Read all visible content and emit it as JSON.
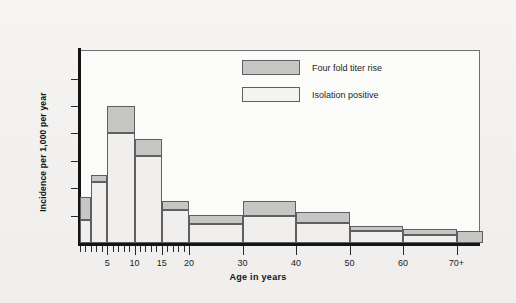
{
  "chart_data": {
    "type": "bar",
    "title": "",
    "subtitle": "",
    "xlabel": "Age in years",
    "ylabel": "Incidence per 1,000 per year",
    "stacked": true,
    "grid": false,
    "legend_position": "top-center",
    "xlim": [
      0,
      75
    ],
    "ylim": [
      0,
      6.7
    ],
    "y_ticks": [
      1,
      2,
      3,
      4,
      5,
      6
    ],
    "y_tick_labels": [
      "1",
      "2",
      "3",
      "4",
      "5",
      "6"
    ],
    "x_major_ticks": [
      5,
      10,
      15,
      20,
      30,
      40,
      50,
      60,
      70
    ],
    "x_tick_labels": [
      "5",
      "10",
      "15",
      "20",
      "30",
      "40",
      "50",
      "60",
      "70+"
    ],
    "x_minor_tick_step": 1,
    "x_minor_tick_range": [
      0,
      20
    ],
    "categories": [
      "0-2",
      "2-5",
      "5-10",
      "10-15",
      "15-20",
      "20-30",
      "30-40",
      "40-50",
      "50-60",
      "60-70",
      "70+"
    ],
    "bin_edges": [
      0,
      2,
      5,
      10,
      15,
      20,
      30,
      40,
      50,
      60,
      70,
      75
    ],
    "series": [
      {
        "name": "Isolation positive",
        "color": "#f0efed",
        "values": [
          0.84,
          2.22,
          4.0,
          3.16,
          1.2,
          0.69,
          1.0,
          0.72,
          0.42,
          0.29,
          0.0
        ]
      },
      {
        "name": "Four fold titer rise",
        "color": "#c6c6c4",
        "values": [
          0.83,
          0.25,
          1.0,
          0.62,
          0.35,
          0.33,
          0.55,
          0.4,
          0.21,
          0.23,
          0.43
        ]
      }
    ],
    "totals": [
      1.67,
      2.47,
      5.0,
      3.78,
      1.55,
      1.02,
      1.55,
      1.12,
      0.63,
      0.52,
      0.43
    ]
  },
  "legend": {
    "items": [
      {
        "label": "Four fold titer rise",
        "swatch": "gray"
      },
      {
        "label": "Isolation positive",
        "swatch": "white"
      }
    ]
  },
  "axes": {
    "y_title": "Incidence per 1,000 per year",
    "x_title": "Age in years"
  }
}
